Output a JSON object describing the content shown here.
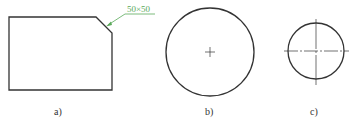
{
  "figures": [
    {
      "id": "a",
      "label": "a)",
      "shape": "chamfered-rectangle",
      "annotation": "50×50"
    },
    {
      "id": "b",
      "label": "b)",
      "shape": "circle-with-center-cross"
    },
    {
      "id": "c",
      "label": "c)",
      "shape": "circle-with-centerlines"
    }
  ],
  "colors": {
    "line": "#333333",
    "annotation": "#5aa95a"
  }
}
